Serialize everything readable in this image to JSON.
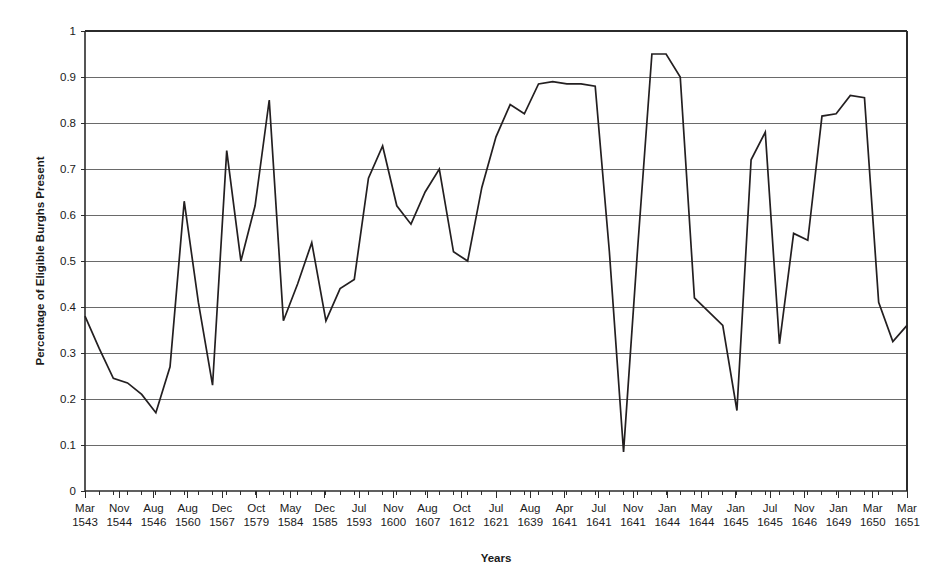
{
  "chart_data": {
    "type": "line",
    "title": "",
    "xlabel": "Years",
    "ylabel": "Percentage of Eligible Burghs Present",
    "ylim": [
      0,
      1
    ],
    "yticks": [
      0,
      0.1,
      0.2,
      0.3,
      0.4,
      0.5,
      0.6,
      0.7,
      0.8,
      0.9,
      1
    ],
    "ytick_labels": [
      "0",
      "0.1",
      "0.2",
      "0.3",
      "0.4",
      "0.5",
      "0.6",
      "0.7",
      "0.8",
      "0.9",
      "1"
    ],
    "grid": true,
    "legend": "none",
    "xtick_labels": [
      "Mar\n1543",
      "Nov\n1544",
      "Aug\n1546",
      "Aug\n1560",
      "Dec\n1567",
      "Oct\n1579",
      "May\n1584",
      "Dec\n1585",
      "Jul\n1593",
      "Nov\n1600",
      "Aug\n1607",
      "Oct\n1612",
      "Jul\n1621",
      "Aug\n1639",
      "Apr\n1641",
      "Jul\n1641",
      "Nov\n1641",
      "Jan\n1644",
      "May\n1644",
      "Jan\n1645",
      "Jul\n1645",
      "Nov\n1646",
      "Jan\n1649",
      "Mar\n1650",
      "Mar\n1651"
    ],
    "xtick_months": [
      "Mar",
      "Nov",
      "Aug",
      "Aug",
      "Dec",
      "Oct",
      "May",
      "Dec",
      "Jul",
      "Nov",
      "Aug",
      "Oct",
      "Jul",
      "Aug",
      "Apr",
      "Jul",
      "Nov",
      "Jan",
      "May",
      "Jan",
      "Jul",
      "Nov",
      "Jan",
      "Mar",
      "Mar"
    ],
    "xtick_years": [
      "1543",
      "1544",
      "1546",
      "1560",
      "1567",
      "1579",
      "1584",
      "1585",
      "1593",
      "1600",
      "1607",
      "1612",
      "1621",
      "1639",
      "1641",
      "1641",
      "1641",
      "1644",
      "1644",
      "1645",
      "1645",
      "1646",
      "1649",
      "1650",
      "1651"
    ],
    "values": [
      0.38,
      0.31,
      0.245,
      0.235,
      0.21,
      0.17,
      0.27,
      0.63,
      0.41,
      0.23,
      0.74,
      0.5,
      0.62,
      0.85,
      0.37,
      0.45,
      0.54,
      0.37,
      0.44,
      0.46,
      0.68,
      0.75,
      0.62,
      0.58,
      0.65,
      0.7,
      0.52,
      0.5,
      0.66,
      0.77,
      0.84,
      0.82,
      0.885,
      0.89,
      0.885,
      0.885,
      0.88,
      0.52,
      0.085,
      0.53,
      0.95,
      0.95,
      0.9,
      0.42,
      0.39,
      0.36,
      0.175,
      0.72,
      0.78,
      0.32,
      0.56,
      0.545,
      0.815,
      0.82,
      0.86,
      0.855,
      0.41,
      0.325,
      0.36
    ],
    "series_color": "#231f20",
    "n_points": 59
  }
}
